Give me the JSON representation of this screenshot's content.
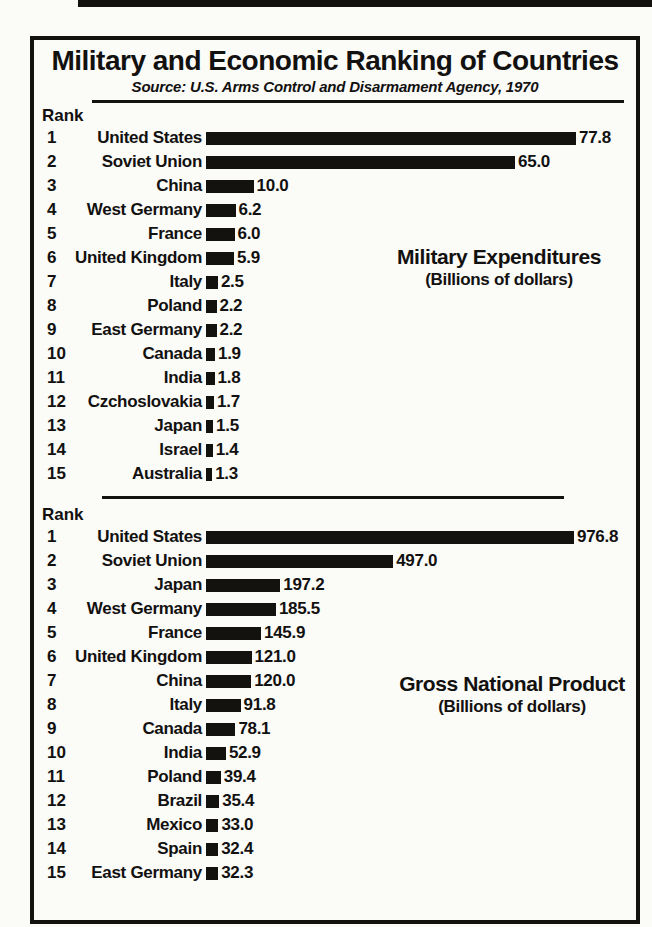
{
  "header": {
    "title": "Military and Economic Ranking of Countries",
    "source": "Source: U.S. Arms Control and Disarmament Agency, 1970"
  },
  "colors": {
    "ink": "#14120f",
    "paper": "#fbfbf8",
    "bar": "#14120f"
  },
  "chart_data": [
    {
      "type": "bar",
      "title": "Military Expenditures",
      "subtitle": "(Billions of dollars)",
      "rank_header": "Rank",
      "ranks": [
        1,
        2,
        3,
        4,
        5,
        6,
        7,
        8,
        9,
        10,
        11,
        12,
        13,
        14,
        15
      ],
      "categories": [
        "United States",
        "Soviet Union",
        "China",
        "West Germany",
        "France",
        "United Kingdom",
        "Italy",
        "Poland",
        "East Germany",
        "Canada",
        "India",
        "Czchoslovakia",
        "Japan",
        "Israel",
        "Australia"
      ],
      "values": [
        77.8,
        65.0,
        10.0,
        6.2,
        6.0,
        5.9,
        2.5,
        2.2,
        2.2,
        1.9,
        1.8,
        1.7,
        1.5,
        1.4,
        1.3
      ],
      "value_labels": [
        "77.8",
        "65.0",
        "10.0",
        "6.2",
        "6.0",
        "5.9",
        "2.5",
        "2.2",
        "2.2",
        "1.9",
        "1.8",
        "1.7",
        "1.5",
        "1.4",
        "1.3"
      ],
      "xlabel": "Billions of dollars",
      "ylabel": "Rank",
      "xlim": [
        0,
        80
      ],
      "grid": false,
      "legend": false,
      "orientation": "horizontal",
      "bar_color": "#14120f"
    },
    {
      "type": "bar",
      "title": "Gross National Product",
      "subtitle": "(Billions of dollars)",
      "rank_header": "Rank",
      "ranks": [
        1,
        2,
        3,
        4,
        5,
        6,
        7,
        8,
        9,
        10,
        11,
        12,
        13,
        14,
        15
      ],
      "categories": [
        "United States",
        "Soviet Union",
        "Japan",
        "West Germany",
        "France",
        "United Kingdom",
        "China",
        "Italy",
        "Canada",
        "India",
        "Poland",
        "Brazil",
        "Mexico",
        "Spain",
        "East Germany"
      ],
      "values": [
        976.8,
        497.0,
        197.2,
        185.5,
        145.9,
        121.0,
        120.0,
        91.8,
        78.1,
        52.9,
        39.4,
        35.4,
        33.0,
        32.4,
        32.3
      ],
      "value_labels": [
        "976.8",
        "497.0",
        "197.2",
        "185.5",
        "145.9",
        "121.0",
        "120.0",
        "91.8",
        "78.1",
        "52.9",
        "39.4",
        "35.4",
        "33.0",
        "32.4",
        "32.3"
      ],
      "xlabel": "Billions of dollars",
      "ylabel": "Rank",
      "xlim": [
        0,
        1000
      ],
      "grid": false,
      "legend": false,
      "orientation": "horizontal",
      "bar_color": "#14120f"
    }
  ]
}
